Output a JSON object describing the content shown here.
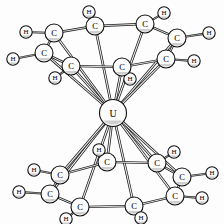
{
  "figure": {
    "type": "ball-and-stick-molecular-diagram",
    "formula": "U(C8H8)2",
    "background_color": "#fdfdfd",
    "atom_fill_color": "#fbfbfb",
    "atom_stroke_color": "#111111",
    "bond_color": "#1a1a1a"
  },
  "atoms": {
    "metal": [
      {
        "id": "U1",
        "label": "U",
        "x": 113,
        "y": 113,
        "r": 13.5
      }
    ],
    "top_ring_carbons": [
      {
        "id": "C1",
        "label": "C",
        "x": 95,
        "y": 26,
        "r": 9.0
      },
      {
        "id": "C2",
        "label": "C",
        "x": 145,
        "y": 24,
        "r": 9.0
      },
      {
        "id": "C3",
        "label": "C",
        "x": 177,
        "y": 38,
        "r": 9.0
      },
      {
        "id": "C4",
        "label": "C",
        "x": 166,
        "y": 59,
        "r": 9.0
      },
      {
        "id": "C5",
        "label": "C",
        "x": 122,
        "y": 67,
        "r": 9.0
      },
      {
        "id": "C6",
        "label": "C",
        "x": 71,
        "y": 66,
        "r": 9.0
      },
      {
        "id": "C7",
        "label": "C",
        "x": 44,
        "y": 53,
        "r": 9.0
      },
      {
        "id": "C8",
        "label": "C",
        "x": 54,
        "y": 33,
        "r": 9.0
      }
    ],
    "top_ring_hydrogens": [
      {
        "id": "H1",
        "label": "H",
        "x": 89,
        "y": 12,
        "r": 6.2,
        "bonded_to": "C1"
      },
      {
        "id": "H2",
        "label": "H",
        "x": 164,
        "y": 13,
        "r": 6.2,
        "bonded_to": "C2"
      },
      {
        "id": "H3",
        "label": "H",
        "x": 209,
        "y": 33,
        "r": 6.2,
        "bonded_to": "C3"
      },
      {
        "id": "H4",
        "label": "H",
        "x": 194,
        "y": 61,
        "r": 6.2,
        "bonded_to": "C4"
      },
      {
        "id": "H5",
        "label": "H",
        "x": 130,
        "y": 79,
        "r": 6.2,
        "bonded_to": "C5"
      },
      {
        "id": "H6",
        "label": "H",
        "x": 55,
        "y": 78,
        "r": 6.2,
        "bonded_to": "C6"
      },
      {
        "id": "H7",
        "label": "H",
        "x": 13,
        "y": 59,
        "r": 6.2,
        "bonded_to": "C7"
      },
      {
        "id": "H8",
        "label": "H",
        "x": 26,
        "y": 32,
        "r": 6.2,
        "bonded_to": "C8"
      }
    ],
    "bottom_ring_carbons": [
      {
        "id": "C9",
        "label": "C",
        "x": 107,
        "y": 162,
        "r": 9.0
      },
      {
        "id": "C10",
        "label": "C",
        "x": 157,
        "y": 163,
        "r": 9.0
      },
      {
        "id": "C11",
        "label": "C",
        "x": 182,
        "y": 177,
        "r": 9.0
      },
      {
        "id": "C12",
        "label": "C",
        "x": 175,
        "y": 196,
        "r": 9.0
      },
      {
        "id": "C13",
        "label": "C",
        "x": 134,
        "y": 206,
        "r": 9.0
      },
      {
        "id": "C14",
        "label": "C",
        "x": 80,
        "y": 207,
        "r": 9.0
      },
      {
        "id": "C15",
        "label": "C",
        "x": 50,
        "y": 194,
        "r": 9.0
      },
      {
        "id": "C16",
        "label": "C",
        "x": 60,
        "y": 175,
        "r": 9.0
      }
    ],
    "bottom_ring_hydrogens": [
      {
        "id": "H9",
        "label": "H",
        "x": 99,
        "y": 150,
        "r": 6.2,
        "bonded_to": "C9"
      },
      {
        "id": "H10",
        "label": "H",
        "x": 174,
        "y": 152,
        "r": 6.2,
        "bonded_to": "C10"
      },
      {
        "id": "H11",
        "label": "H",
        "x": 212,
        "y": 173,
        "r": 6.2,
        "bonded_to": "C11"
      },
      {
        "id": "H12",
        "label": "H",
        "x": 202,
        "y": 198,
        "r": 6.2,
        "bonded_to": "C12"
      },
      {
        "id": "H13",
        "label": "H",
        "x": 141,
        "y": 218,
        "r": 6.2,
        "bonded_to": "C13"
      },
      {
        "id": "H14",
        "label": "H",
        "x": 66,
        "y": 219,
        "r": 6.2,
        "bonded_to": "C14"
      },
      {
        "id": "H15",
        "label": "H",
        "x": 19,
        "y": 192,
        "r": 6.2,
        "bonded_to": "C15"
      },
      {
        "id": "H16",
        "label": "H",
        "x": 34,
        "y": 170,
        "r": 6.2,
        "bonded_to": "C16"
      }
    ]
  },
  "bonds": {
    "top_ring_cc": [
      [
        "C1",
        "C2"
      ],
      [
        "C2",
        "C3"
      ],
      [
        "C3",
        "C4"
      ],
      [
        "C4",
        "C5"
      ],
      [
        "C5",
        "C6"
      ],
      [
        "C6",
        "C7"
      ],
      [
        "C7",
        "C8"
      ],
      [
        "C8",
        "C1"
      ]
    ],
    "bottom_ring_cc": [
      [
        "C9",
        "C10"
      ],
      [
        "C10",
        "C11"
      ],
      [
        "C11",
        "C12"
      ],
      [
        "C12",
        "C13"
      ],
      [
        "C13",
        "C14"
      ],
      [
        "C14",
        "C15"
      ],
      [
        "C15",
        "C16"
      ],
      [
        "C16",
        "C9"
      ]
    ],
    "top_ch": [
      [
        "C1",
        "H1"
      ],
      [
        "C2",
        "H2"
      ],
      [
        "C3",
        "H3"
      ],
      [
        "C4",
        "H4"
      ],
      [
        "C5",
        "H5"
      ],
      [
        "C6",
        "H6"
      ],
      [
        "C7",
        "H7"
      ],
      [
        "C8",
        "H8"
      ]
    ],
    "bottom_ch": [
      [
        "C9",
        "H9"
      ],
      [
        "C10",
        "H10"
      ],
      [
        "C11",
        "H11"
      ],
      [
        "C12",
        "H12"
      ],
      [
        "C13",
        "H13"
      ],
      [
        "C14",
        "H14"
      ],
      [
        "C15",
        "H15"
      ],
      [
        "C16",
        "H16"
      ]
    ],
    "metal_to_top": [
      [
        "U1",
        "C1"
      ],
      [
        "U1",
        "C2"
      ],
      [
        "U1",
        "C3"
      ],
      [
        "U1",
        "C4"
      ],
      [
        "U1",
        "C5"
      ],
      [
        "U1",
        "C6"
      ],
      [
        "U1",
        "C7"
      ],
      [
        "U1",
        "C8"
      ]
    ],
    "metal_to_bottom": [
      [
        "U1",
        "C9"
      ],
      [
        "U1",
        "C10"
      ],
      [
        "U1",
        "C11"
      ],
      [
        "U1",
        "C12"
      ],
      [
        "U1",
        "C13"
      ],
      [
        "U1",
        "C14"
      ],
      [
        "U1",
        "C15"
      ],
      [
        "U1",
        "C16"
      ]
    ]
  },
  "labels": {
    "carbon": "C",
    "hydrogen": "H",
    "uranium": "U"
  }
}
